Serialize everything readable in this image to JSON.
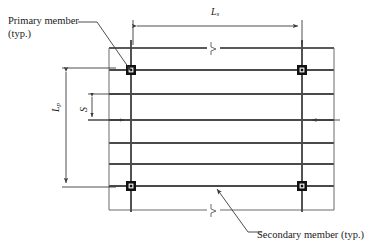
{
  "figure": {
    "type": "engineering-framing-plan-diagram",
    "background_color": "#ffffff",
    "line_color": "#3a3a3a",
    "heavy_line_color": "#4a4a4a",
    "text_color": "#1a1a1a"
  },
  "annotations": {
    "primary_member": {
      "line1": "Primary member",
      "line2": "(typ.)",
      "leader_from": [
        97,
        22
      ],
      "leader_to": [
        131,
        71
      ]
    },
    "secondary_member": {
      "text": "Secondary member (typ.)",
      "leader_from": [
        257,
        232
      ],
      "leader_to": [
        217,
        187
      ]
    }
  },
  "dimensions": {
    "horizontal_span": {
      "symbol": "L",
      "subscript": "s",
      "x_start": 133,
      "x_end": 302,
      "y": 26
    },
    "vertical_span": {
      "symbol": "L",
      "subscript": "p",
      "y_start": 68,
      "y_end": 187,
      "x": 66
    },
    "spacing": {
      "symbol": "S",
      "y_start": 94,
      "y_end": 120,
      "x": 92
    }
  },
  "grid": {
    "secondary_members_y": [
      48,
      70,
      94,
      120,
      143,
      164,
      186
    ],
    "secondary_member_x_start": 109,
    "secondary_member_x_end": 334,
    "primary_members_x": [
      131,
      302
    ],
    "primary_member_y_start": 40,
    "primary_member_y_end": 212,
    "edge_verticals_x": [
      109,
      334
    ],
    "edge_vertical_y_start": 48,
    "edge_vertical_y_end": 210,
    "bottom_secondary_y": 210,
    "joints": [
      [
        131,
        70
      ],
      [
        302,
        70
      ],
      [
        131,
        186
      ],
      [
        302,
        186
      ]
    ],
    "break_symbols": [
      [
        213,
        48
      ],
      [
        213,
        210
      ]
    ]
  }
}
